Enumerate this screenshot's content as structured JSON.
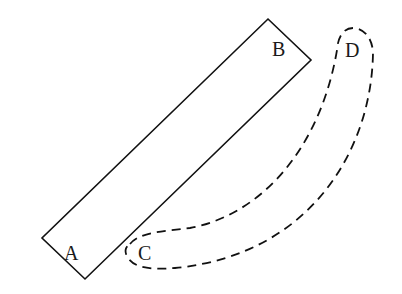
{
  "diagram": {
    "type": "geometry-rotation",
    "labels": {
      "A": "A",
      "B": "B",
      "C": "C",
      "D": "D"
    },
    "rectangle": {
      "corners": [
        [
          268,
          19
        ],
        [
          311,
          60
        ],
        [
          85,
          279
        ],
        [
          42,
          238
        ]
      ],
      "style": "solid"
    },
    "dashed_shape": {
      "style": "dashed",
      "ends": [
        "C",
        "D"
      ]
    },
    "colors": {
      "stroke": "#111111",
      "background": "#ffffff"
    }
  }
}
